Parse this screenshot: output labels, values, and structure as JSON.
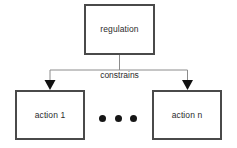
{
  "diagram": {
    "type": "flowchart",
    "nodes": [
      {
        "id": "regulation",
        "label": "regulation",
        "shape": "rectangle"
      },
      {
        "id": "action-1",
        "label": "action 1",
        "shape": "rectangle"
      },
      {
        "id": "action-n",
        "label": "action n",
        "shape": "rectangle"
      }
    ],
    "edges": [
      {
        "from": "regulation",
        "to": "action-1",
        "label": "constrains",
        "arrow": "to"
      },
      {
        "from": "regulation",
        "to": "action-n",
        "label": "constrains",
        "arrow": "to"
      }
    ],
    "edge_label": "constrains",
    "ellipsis": "•••",
    "colors": {
      "background": "#ffffff",
      "node_border": "#4a4a4a",
      "node_fill": "#ffffff",
      "text": "#2b2b2b",
      "connector": "#8c8c8c",
      "arrowhead": "#111111",
      "ellipsis_dot": "#161616"
    }
  }
}
